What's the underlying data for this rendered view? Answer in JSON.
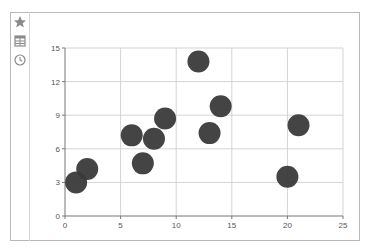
{
  "sidebar": {
    "items": [
      {
        "icon": "star-icon"
      },
      {
        "icon": "table-icon"
      },
      {
        "icon": "clock-icon"
      }
    ]
  },
  "colors": {
    "point": "#3a3a3a",
    "grid": "#d4d4d4",
    "axis": "#777777",
    "frame": "#b8b8b8"
  },
  "chart_data": {
    "type": "scatter",
    "title": "",
    "xlabel": "",
    "ylabel": "",
    "xlim": [
      0,
      25
    ],
    "ylim": [
      0,
      15
    ],
    "x_ticks": [
      0,
      5,
      10,
      15,
      20,
      25
    ],
    "y_ticks": [
      0,
      3,
      6,
      9,
      12,
      15
    ],
    "grid": true,
    "legend": null,
    "series": [
      {
        "name": "points",
        "x": [
          1,
          2,
          6,
          7,
          8,
          9,
          12,
          13,
          14,
          20,
          21
        ],
        "y": [
          3,
          4.2,
          7.2,
          4.7,
          6.9,
          8.7,
          13.8,
          7.4,
          9.8,
          3.5,
          8.1
        ]
      }
    ]
  }
}
